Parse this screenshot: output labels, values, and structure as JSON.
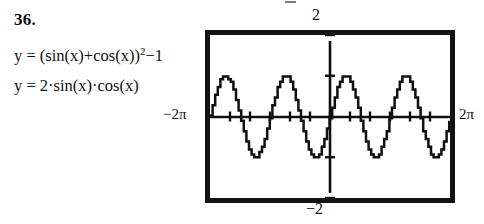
{
  "problem": {
    "number": "36."
  },
  "equations": [
    {
      "id": "equation-1",
      "text": "y = (sin(x)+cos(x))²−1",
      "lhs": "y",
      "rhs": "(sin(x)+cos(x))²−1"
    },
    {
      "id": "equation-2",
      "text": "y = 2·sin(x)·cos(x)",
      "lhs": "y",
      "rhs": "2·sin(x)·cos(x)"
    }
  ],
  "graph": {
    "labels": {
      "y_max": "2",
      "y_min": "−2",
      "x_min": "−2π",
      "x_max": "2π"
    },
    "frame_color": "#131313",
    "curve_color": "#101010",
    "background": "#ffffff"
  },
  "chart_data": {
    "type": "line",
    "title": "",
    "xlabel": "",
    "ylabel": "",
    "xlim": [
      -6.283185307,
      6.283185307
    ],
    "ylim": [
      -2,
      2
    ],
    "xtick_labels": [
      "−2π",
      "2π"
    ],
    "ytick_labels": [
      "−2",
      "2"
    ],
    "xticks": [
      -6.283185307,
      -5.235987756,
      -4.188790205,
      -3.141592654,
      -2.094395102,
      -1.047197551,
      0,
      1.047197551,
      2.094395102,
      3.141592654,
      4.188790205,
      5.235987756,
      6.283185307
    ],
    "yticks": [
      -2,
      -1,
      0,
      1,
      2
    ],
    "grid": false,
    "legend": false,
    "axes_style": "calculator-screen-with-tick-marks",
    "series": [
      {
        "name": "y = (sin(x)+cos(x))²−1",
        "expression": "sin(2x)",
        "amplitude": 1,
        "period": 3.141592654,
        "phase": 0,
        "color": "#101010",
        "note": "identical graph to second equation (trigonometric identity)"
      },
      {
        "name": "y = 2·sin(x)·cos(x)",
        "expression": "sin(2x)",
        "amplitude": 1,
        "period": 3.141592654,
        "phase": 0,
        "color": "#101010",
        "note": "overlaps the first curve exactly; 4 full cycles shown across −2π..2π"
      }
    ],
    "cycles_visible": 4,
    "annotation": "Both equations simplify to sin(2x); the two graphs coincide."
  }
}
